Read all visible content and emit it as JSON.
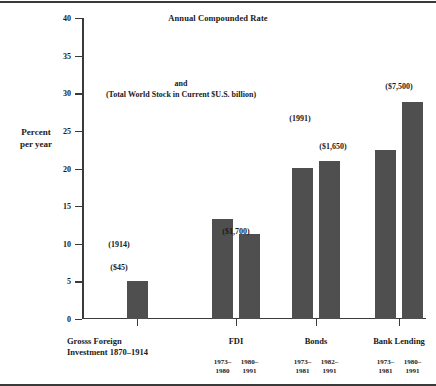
{
  "chart_data": {
    "type": "bar",
    "title": "Annual Compounded Rate",
    "subtitle": "and\n(Total World Stock in Current $U.S. billion)",
    "subtitle_line1": "and",
    "subtitle_line2": "(Total World Stock in Current $U.S. billion)",
    "xlabel": "",
    "ylabel": "Percent per year",
    "ylabel_line1": "Percent",
    "ylabel_line2": "per year",
    "ylim": [
      0,
      40
    ],
    "ytick_step": 5,
    "yticks": [
      "0",
      "5",
      "10",
      "15",
      "20",
      "25",
      "30",
      "35",
      "40"
    ],
    "grid": false,
    "legend": "none",
    "bar_color": "#4f4f4f",
    "axis_color": "#3a3a3a",
    "groups": [
      {
        "name": "Grosss Foreign Investment 1870–1914",
        "name_line1": "Grosss Foreign",
        "name_line2": "Investment 1870–1914",
        "bars": [
          {
            "period": "",
            "period_line1": "",
            "period_line2": "",
            "value": 5.1,
            "annotations": [
              "(1914)",
              "($45)"
            ],
            "ann1": "(1914)",
            "ann2": "($45)"
          }
        ]
      },
      {
        "name": "FDI",
        "bars": [
          {
            "period": "1973–1980",
            "period_line1": "1973–",
            "period_line2": "1980",
            "value": 13.3,
            "annotations": [],
            "ann1": "",
            "ann2": ""
          },
          {
            "period": "1980–1991",
            "period_line1": "1980–",
            "period_line2": "1991",
            "value": 11.3,
            "annotations": [
              "($1,700)"
            ],
            "ann1": "($1,700)",
            "ann2": ""
          }
        ]
      },
      {
        "name": "Bonds",
        "bars": [
          {
            "period": "1973–1981",
            "period_line1": "1973–",
            "period_line2": "1981",
            "value": 20.1,
            "annotations": [
              "(1991)"
            ],
            "ann1": "(1991)",
            "ann2": ""
          },
          {
            "period": "1982–1991",
            "period_line1": "1982–",
            "period_line2": "1991",
            "value": 21.0,
            "annotations": [
              "($1,650)"
            ],
            "ann1": "($1,650)",
            "ann2": ""
          }
        ]
      },
      {
        "name": "Bank Lending",
        "bars": [
          {
            "period": "1973–1981",
            "period_line1": "1973–",
            "period_line2": "1981",
            "value": 22.5,
            "annotations": [],
            "ann1": "",
            "ann2": ""
          },
          {
            "period": "1980–1991",
            "period_line1": "1980–",
            "period_line2": "1991",
            "value": 28.8,
            "annotations": [
              "($7,500)"
            ],
            "ann1": "($7,500)",
            "ann2": ""
          }
        ]
      }
    ],
    "value_annotations": [
      {
        "text": "(1914)",
        "x_px": 119,
        "y_px": 240
      },
      {
        "text": "($45)",
        "x_px": 119,
        "y_px": 263
      },
      {
        "text": "($1,700)",
        "x_px": 236,
        "y_px": 227
      },
      {
        "text": "(1991)",
        "x_px": 300,
        "y_px": 114
      },
      {
        "text": "($1,650)",
        "x_px": 333,
        "y_px": 142
      },
      {
        "text": "($7,500)",
        "x_px": 399,
        "y_px": 82
      }
    ]
  }
}
